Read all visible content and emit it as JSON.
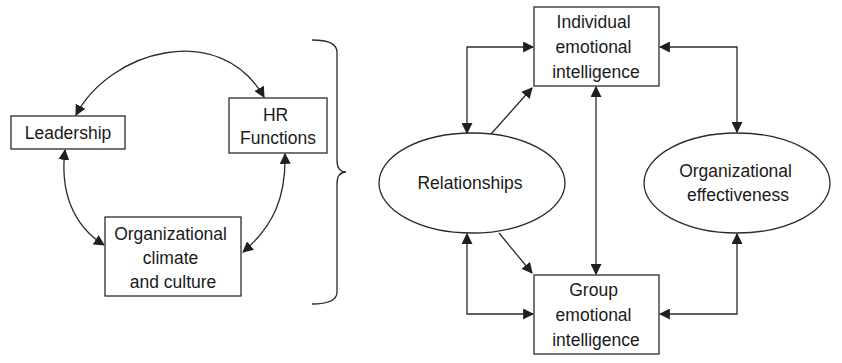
{
  "diagram": {
    "left_group": {
      "nodes": [
        {
          "id": "leadership",
          "shape": "rect",
          "lines": [
            "Leadership"
          ]
        },
        {
          "id": "hr_functions",
          "shape": "rect",
          "lines": [
            "HR",
            "Functions"
          ]
        },
        {
          "id": "org_climate",
          "shape": "rect",
          "lines": [
            "Organizational",
            "climate",
            "and culture"
          ]
        }
      ],
      "edges": [
        {
          "from": "leadership",
          "to": "hr_functions",
          "type": "bidirectional-curved"
        },
        {
          "from": "leadership",
          "to": "org_climate",
          "type": "bidirectional-curved"
        },
        {
          "from": "hr_functions",
          "to": "org_climate",
          "type": "bidirectional-curved"
        }
      ],
      "brace": "right-curly-brace"
    },
    "right_group": {
      "nodes": [
        {
          "id": "individual_ei",
          "shape": "rect",
          "lines": [
            "Individual",
            "emotional",
            "intelligence"
          ]
        },
        {
          "id": "group_ei",
          "shape": "rect",
          "lines": [
            "Group",
            "emotional",
            "intelligence"
          ]
        },
        {
          "id": "relationships",
          "shape": "ellipse",
          "lines": [
            "Relationships"
          ]
        },
        {
          "id": "org_effectiveness",
          "shape": "ellipse",
          "lines": [
            "Organizational",
            "effectiveness"
          ]
        }
      ],
      "edges": [
        {
          "from": "relationships",
          "to": "individual_ei",
          "type": "bidirectional-elbow"
        },
        {
          "from": "relationships",
          "to": "individual_ei",
          "type": "directed-diagonal"
        },
        {
          "from": "relationships",
          "to": "group_ei",
          "type": "bidirectional-elbow"
        },
        {
          "from": "relationships",
          "to": "group_ei",
          "type": "directed-diagonal"
        },
        {
          "from": "individual_ei",
          "to": "group_ei",
          "type": "bidirectional-vertical"
        },
        {
          "from": "individual_ei",
          "to": "org_effectiveness",
          "type": "bidirectional-elbow"
        },
        {
          "from": "group_ei",
          "to": "org_effectiveness",
          "type": "bidirectional-elbow"
        }
      ]
    },
    "colors": {
      "stroke": "#2b2b2b",
      "text": "#1a1a1a",
      "background": "#ffffff"
    }
  }
}
